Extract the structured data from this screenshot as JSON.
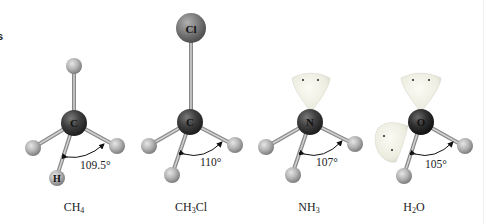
{
  "figure": {
    "cut_text_fragment": "s",
    "molecules": [
      {
        "id": "ch4",
        "formula_parts": [
          "CH",
          "4",
          ""
        ],
        "center_atom": "C",
        "labeled_h": "H",
        "bond_angle": "109.5°",
        "lone_pairs": 0,
        "substituent_top": "H"
      },
      {
        "id": "ch3cl",
        "formula_parts": [
          "CH",
          "3",
          "Cl"
        ],
        "center_atom": "C",
        "bond_angle": "110°",
        "lone_pairs": 0,
        "substituent_top": "Cl"
      },
      {
        "id": "nh3",
        "formula_parts": [
          "NH",
          "3",
          ""
        ],
        "center_atom": "N",
        "bond_angle": "107°",
        "lone_pairs": 1
      },
      {
        "id": "h2o",
        "formula_parts": [
          "H",
          "2",
          "O"
        ],
        "center_atom": "O",
        "bond_angle": "105°",
        "lone_pairs": 2
      }
    ],
    "colors": {
      "carbon": "#3a3a3a",
      "nitrogen": "#3c3c3c",
      "oxygen": "#2a2a2a",
      "chlorine": "#7a7a7a",
      "hydrogen": "#b5b5b5",
      "bond": "#9a9a9a",
      "lone_pair_lobe": "#f2f2e6",
      "background": "#ffffff"
    }
  }
}
